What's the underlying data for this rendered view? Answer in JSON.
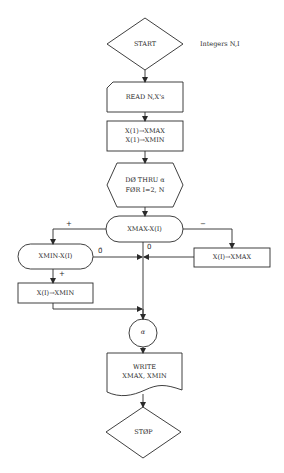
{
  "diagram": {
    "type": "flowchart",
    "annotation": "Integers N,I",
    "nodes": {
      "start": "START",
      "read": "READ N,X's",
      "init_line1": "X(1)→XMAX",
      "init_line2": "X(1)→XMIN",
      "loop_line1": "DØ THRU α",
      "loop_line2": "FØR I=2, N",
      "cmp_max": "XMAX-X(I)",
      "cmp_min": "XMIN-X(I)",
      "set_max": "X(I)→XMAX",
      "set_min": "X(I)→XMIN",
      "connector": "α",
      "write_line1": "WRITE",
      "write_line2": "XMAX, XMIN",
      "stop": "STØP"
    },
    "edge_labels": {
      "max_plus": "+",
      "max_minus": "−",
      "max_zero": "0",
      "min_plus": "+",
      "min_notzero": "0̄"
    },
    "colors": {
      "line": "#2a2a2a",
      "background": "#ffffff"
    }
  }
}
